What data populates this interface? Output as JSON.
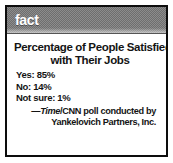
{
  "box": {
    "header_label": "fact",
    "title_line1": "Percentage of People Satisfied",
    "title_line2": "with Their Jobs",
    "results": [
      {
        "label": "Yes:",
        "value": "85%",
        "text": "Yes: 85%"
      },
      {
        "label": "No:",
        "value": "14%",
        "text": "No: 14%"
      },
      {
        "label": "Not sure:",
        "value": "1%",
        "text": "Not sure: 1%"
      }
    ],
    "attribution": {
      "dash": "—",
      "source_italic": "Time",
      "line1_rest": "/CNN poll conducted by",
      "line2": "Yankelovich Partners, Inc."
    }
  },
  "colors": {
    "border": "#0d0d0d",
    "header_band": "#8c8c8c",
    "header_text": "#ffffff",
    "body_text": "#141414",
    "page_background": "#ffffff"
  },
  "chart_data": {
    "type": "table",
    "title": "Percentage of People Satisfied with Their Jobs",
    "categories": [
      "Yes",
      "No",
      "Not sure"
    ],
    "values": [
      85,
      14,
      1
    ],
    "unit": "%",
    "ylabel": "Percentage of respondents",
    "xlabel": "",
    "annotations": [
      "—Time/CNN poll conducted by Yankelovich Partners, Inc."
    ]
  }
}
